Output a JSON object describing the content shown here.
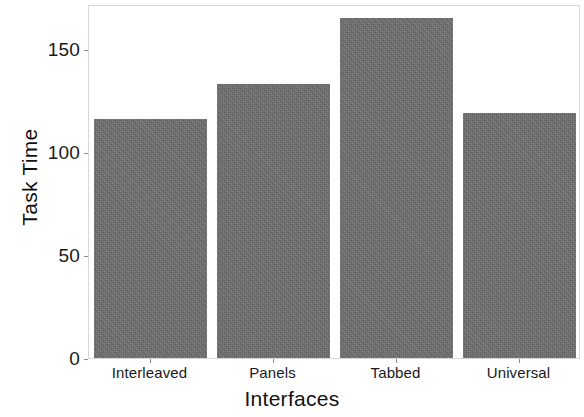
{
  "chart_data": {
    "type": "bar",
    "title": "",
    "categories": [
      "Interleaved",
      "Panels",
      "Tabbed",
      "Universal"
    ],
    "values": [
      116,
      133,
      165,
      119
    ],
    "xlabel": "Interfaces",
    "ylabel": "Task Time",
    "ylim": [
      0,
      172
    ],
    "yticks": [
      0,
      50,
      100,
      150
    ],
    "ytick_labels": [
      "0",
      "50",
      "100",
      "150"
    ],
    "grid": false,
    "legend": null,
    "bar_color": "#6e6e6e",
    "panel_border_color": "#d8d8d8",
    "background": "#ffffff"
  }
}
